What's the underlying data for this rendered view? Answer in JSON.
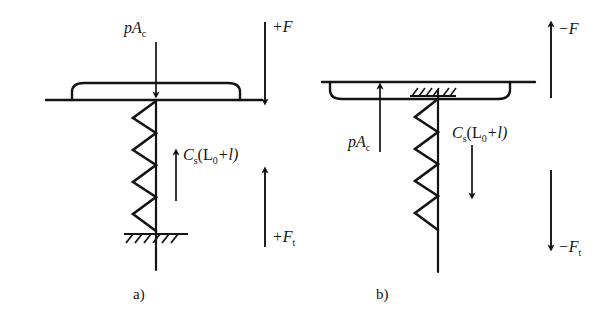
{
  "figure": {
    "title_caption_a": "a)",
    "title_caption_b": "b)",
    "stroke_color": "#141414",
    "background_color": "#ffffff"
  },
  "panel_a": {
    "caption": "a)",
    "labels": {
      "pressure_force": "pA",
      "pressure_force_sub": "c",
      "spring_force_head": "C",
      "spring_force_head_sub": "s",
      "spring_force_body": "(L",
      "spring_force_body_sub": "0",
      "spring_force_tail": "+l)",
      "external_force": "+F",
      "total_force": "+F",
      "total_force_sub": "t"
    },
    "arrows": {
      "pressure_force_direction": "down",
      "spring_force_direction": "up",
      "external_force_direction": "down",
      "total_force_direction": "up"
    },
    "elements": {
      "diaphragm": "rounded-plate-bulging-up",
      "spring": "coil-spring-zigzag",
      "rod": "vertical-rod",
      "support": "ground-hatching"
    }
  },
  "panel_b": {
    "caption": "b)",
    "labels": {
      "pressure_force": "pA",
      "pressure_force_sub": "c",
      "spring_force_head": "C",
      "spring_force_head_sub": "s",
      "spring_force_body": "(L",
      "spring_force_body_sub": "0",
      "spring_force_tail": "+l)",
      "external_force": "−F",
      "total_force": "−F",
      "total_force_sub": "t"
    },
    "arrows": {
      "pressure_force_direction": "up",
      "spring_force_direction": "down",
      "external_force_direction": "up",
      "total_force_direction": "down"
    },
    "elements": {
      "diaphragm": "rounded-plate-bulging-down",
      "spring": "coil-spring-zigzag",
      "rod": "vertical-rod",
      "support": "wall-hatching"
    }
  }
}
